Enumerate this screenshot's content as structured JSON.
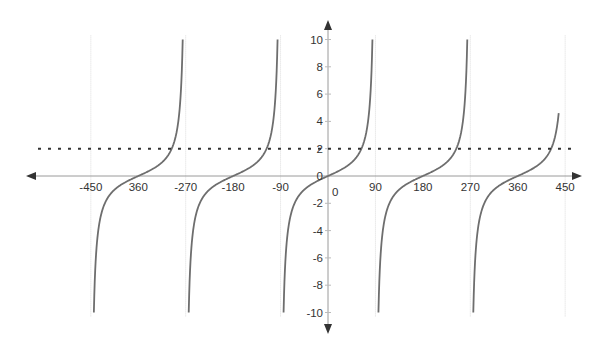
{
  "chart_data": {
    "type": "line",
    "title": "",
    "xlabel": "",
    "ylabel": "",
    "function": "y = tan(x)",
    "xlim": [
      -470,
      470
    ],
    "ylim": [
      -11,
      11
    ],
    "grid": true,
    "x_ticks": [
      -450,
      -360,
      -270,
      -180,
      -90,
      90,
      180,
      270,
      360,
      450
    ],
    "x_tick_labels": [
      "-450",
      "360",
      "-270",
      "-180",
      "-90",
      "90",
      "180",
      "270",
      "360",
      "450"
    ],
    "y_ticks": [
      10,
      8,
      6,
      4,
      2,
      0,
      -2,
      -4,
      -6,
      -8,
      -10
    ],
    "y_tick_labels": [
      "10",
      "8",
      "6",
      "4",
      "2",
      "0",
      "-2",
      "-4",
      "-6",
      "-8",
      "-10"
    ],
    "origin_label": "0",
    "series": [
      {
        "name": "tan(x)",
        "color": "#6e6e6e",
        "branches": [
          {
            "center": -360,
            "x_range": [
              -444.3,
              -275.7
            ],
            "y_range": [
              -10,
              10
            ]
          },
          {
            "center": -180,
            "x_range": [
              -264.3,
              -95.7
            ],
            "y_range": [
              -10,
              10
            ]
          },
          {
            "center": 0,
            "x_range": [
              -84.3,
              84.3
            ],
            "y_range": [
              -10,
              10
            ]
          },
          {
            "center": 180,
            "x_range": [
              95.7,
              264.3
            ],
            "y_range": [
              -10,
              10
            ]
          },
          {
            "center": 360,
            "x_range": [
              275.7,
              437.8
            ],
            "y_range": [
              -10,
              4.6
            ]
          }
        ]
      },
      {
        "name": "y = 2",
        "style": "dashed",
        "color": "#333333",
        "y": 2,
        "x_range": [
          -540,
          460
        ]
      }
    ]
  }
}
